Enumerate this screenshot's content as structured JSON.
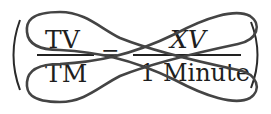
{
  "equation": {
    "left_fraction": {
      "numerator": "TV",
      "denominator": "TM"
    },
    "operator": "=",
    "right_fraction": {
      "numerator": "XV",
      "denominator": "1 Minute"
    },
    "open_paren": "(",
    "close_paren": ")"
  },
  "annotation": {
    "type": "cross-out loops",
    "description": "Two elongated loops crossing in an X over the equation",
    "stroke_color": "#444444"
  },
  "colors": {
    "text": "#1e1e1e",
    "loop_stroke": "#444444",
    "background": "#ffffff"
  }
}
